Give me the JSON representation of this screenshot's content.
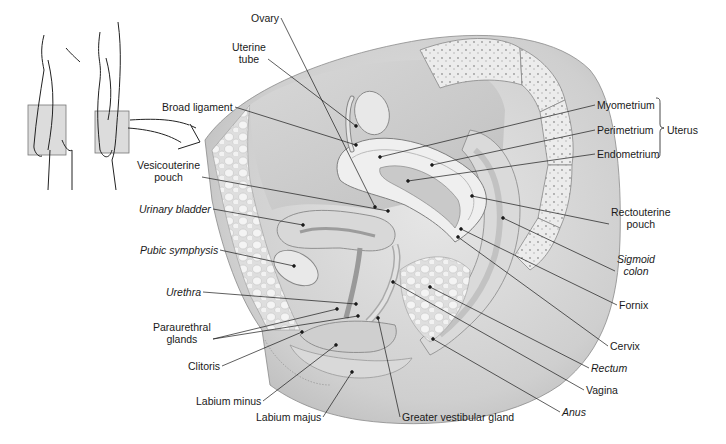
{
  "figure": {
    "orientation_inset": {
      "description": "Outline figures of body (front and side view) with shaded pelvic region box and arrow pointing to detailed view"
    },
    "colors": {
      "background": "#ffffff",
      "line": "#222222",
      "tissue_light": "#ececec",
      "tissue_mid": "#d4d4d4",
      "tissue_dark": "#a8a8a8"
    }
  },
  "labels": [
    {
      "id": "ovary",
      "text": "Ovary",
      "italic": false,
      "x": 251,
      "y": 12,
      "dot": [
        375,
        207
      ]
    },
    {
      "id": "uterine-tube",
      "text": "Uterine\ntube",
      "italic": false,
      "x": 232,
      "y": 41,
      "dot": [
        356,
        126
      ]
    },
    {
      "id": "broad-ligament",
      "text": "Broad ligament",
      "italic": false,
      "x": 162,
      "y": 101,
      "dot": [
        356,
        145
      ]
    },
    {
      "id": "myometrium",
      "text": "Myometrium",
      "italic": false,
      "x": 597,
      "y": 99,
      "dot": [
        380,
        157
      ]
    },
    {
      "id": "perimetrium",
      "text": "Perimetrium",
      "italic": false,
      "x": 597,
      "y": 124,
      "dot": [
        432,
        165
      ]
    },
    {
      "id": "endometrium",
      "text": "Endometrium",
      "italic": false,
      "x": 597,
      "y": 148,
      "dot": [
        408,
        181
      ]
    },
    {
      "id": "uterus",
      "text": "Uterus",
      "italic": false,
      "x": 667,
      "y": 124,
      "bracket": true
    },
    {
      "id": "vesicouterine-pouch",
      "text": "Vesicouterine\npouch",
      "italic": false,
      "x": 137,
      "y": 159,
      "dot": [
        388,
        211
      ]
    },
    {
      "id": "urinary-bladder",
      "text": "Urinary bladder",
      "italic": true,
      "x": 139,
      "y": 203,
      "dot": [
        303,
        225
      ]
    },
    {
      "id": "rectouterine-pouch",
      "text": "Rectouterine\npouch",
      "italic": false,
      "x": 611,
      "y": 206,
      "dot": [
        472,
        196
      ]
    },
    {
      "id": "pubic-symphysis",
      "text": "Pubic symphysis",
      "italic": true,
      "x": 140,
      "y": 244,
      "dot": [
        294,
        266
      ]
    },
    {
      "id": "sigmoid-colon",
      "text": "Sigmoid\ncolon",
      "italic": true,
      "x": 617,
      "y": 253,
      "dot": [
        503,
        218
      ]
    },
    {
      "id": "urethra",
      "text": "Urethra",
      "italic": true,
      "x": 166,
      "y": 286,
      "dot": [
        356,
        304
      ]
    },
    {
      "id": "fornix",
      "text": "Fornix",
      "italic": false,
      "x": 619,
      "y": 299,
      "dot": [
        461,
        229
      ]
    },
    {
      "id": "paraurethral-glands",
      "text": "Paraurethral\nglands",
      "italic": false,
      "x": 153,
      "y": 321,
      "dots": [
        [
          337,
          309
        ],
        [
          358,
          316
        ]
      ]
    },
    {
      "id": "cervix",
      "text": "Cervix",
      "italic": false,
      "x": 610,
      "y": 340,
      "dot": [
        458,
        237
      ]
    },
    {
      "id": "clitoris",
      "text": "Clitoris",
      "italic": false,
      "x": 188,
      "y": 360,
      "dot": [
        302,
        332
      ]
    },
    {
      "id": "rectum",
      "text": "Rectum",
      "italic": true,
      "x": 591,
      "y": 362,
      "dot": [
        430,
        287
      ]
    },
    {
      "id": "vagina",
      "text": "Vagina",
      "italic": false,
      "x": 586,
      "y": 384,
      "dot": [
        393,
        282
      ]
    },
    {
      "id": "labium-minus",
      "text": "Labium minus",
      "italic": false,
      "x": 196,
      "y": 395,
      "dot": [
        336,
        345
      ]
    },
    {
      "id": "greater-vestibular-gland",
      "text": "Greater vestibular gland",
      "italic": false,
      "x": 402,
      "y": 411,
      "dot": [
        378,
        318
      ]
    },
    {
      "id": "anus",
      "text": "Anus",
      "italic": true,
      "x": 562,
      "y": 406,
      "dot": [
        433,
        339
      ]
    },
    {
      "id": "labium-majus",
      "text": "Labium majus",
      "italic": false,
      "x": 256,
      "y": 411,
      "dot": [
        352,
        372
      ]
    }
  ]
}
